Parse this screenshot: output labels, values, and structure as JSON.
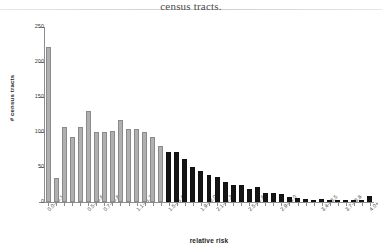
{
  "caption": {
    "text": "census tracts."
  },
  "chart_data": {
    "type": "bar",
    "title": "",
    "xlabel": "relative risk",
    "ylabel": "# census tracts",
    "ylim": [
      0,
      250
    ],
    "ytick_values": [
      0,
      50,
      100,
      150,
      200,
      250
    ],
    "ytick_labels": [
      "0",
      "50",
      "100",
      "150",
      "200",
      "250"
    ],
    "grid": false,
    "legend": "none",
    "series_colors": {
      "low": "#b0b0b0",
      "high": "#151515"
    },
    "categories": [
      "0.0-<0.1",
      "0.1-<0.2",
      "0.2-<0.3",
      "0.3-<0.4",
      "0.4-<0.5",
      "0.5-<0.6",
      "0.6-<0.7",
      "0.7-<0.8",
      "0.8-<0.9",
      "0.9-<1.0",
      "1.0-<1.1",
      "1.1-<1.2",
      "1.2-<1.3",
      "1.3-<1.4",
      "1.4-<1.5",
      "1.5-<1.6",
      "1.6-<1.7",
      "1.7-<1.8",
      "1.8-<1.9",
      "1.9-<2.0",
      "2.0-<2.1",
      "2.1-<2.2",
      "2.2-<2.3",
      "2.3-<2.4",
      "2.4-<2.5",
      "2.5-<2.6",
      "2.6-<2.7",
      "2.7-<2.8",
      "2.8-<2.9",
      "2.9-<3.0",
      "3.0-<3.1",
      "3.1-<3.2",
      "3.2-<3.3",
      "3.3-<3.4",
      "3.4-<3.5",
      "3.5-<3.6",
      "3.6-<3.7",
      "3.7-<3.8",
      "3.8-<3.9",
      "3.9-<4.0",
      "4.0+"
    ],
    "tick_labels_shown": [
      "0.0-<0.1",
      "0.5-<0.6",
      "0.7-<0.8",
      "1.1-<1.2",
      "1.5-<1.6",
      "1.9-<2.0",
      "2.1-<2.2",
      "2.5-<2.6",
      "2.9-<3.0",
      "3.4-<3.5",
      "3.7-<3.8",
      "4.0+"
    ],
    "values": [
      222,
      34,
      107,
      93,
      107,
      130,
      100,
      100,
      102,
      117,
      105,
      105,
      100,
      93,
      80,
      71,
      71,
      62,
      50,
      45,
      38,
      36,
      28,
      24,
      24,
      18,
      22,
      13,
      13,
      11,
      7,
      6,
      4,
      3,
      4,
      3,
      2,
      3,
      3,
      2,
      9
    ],
    "bar_groups": [
      {
        "name": "relative risk below 1.4",
        "color": "#b0b0b0",
        "start_index": 0,
        "end_index": 14
      },
      {
        "name": "relative risk 1.4 and above",
        "color": "#151515",
        "start_index": 15,
        "end_index": 40
      }
    ]
  }
}
